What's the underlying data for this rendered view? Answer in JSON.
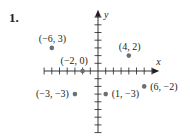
{
  "problem": {
    "number": "1."
  },
  "chart_data": {
    "type": "scatter",
    "title": "",
    "xlabel": "x",
    "ylabel": "y",
    "xlim": [
      -7,
      7
    ],
    "ylim": [
      -8,
      7
    ],
    "grid": false,
    "tick_spacing": 1,
    "points": [
      {
        "x": -6,
        "y": 3,
        "label": "(−6, 3)"
      },
      {
        "x": 4,
        "y": 2,
        "label": "(4, 2)"
      },
      {
        "x": -2,
        "y": 0,
        "label": "(−2, 0)"
      },
      {
        "x": 6,
        "y": -2,
        "label": "(6, −2)"
      },
      {
        "x": -3,
        "y": -3,
        "label": "(−3, −3)"
      },
      {
        "x": 1,
        "y": -3,
        "label": "(1, −3)"
      }
    ]
  },
  "colors": {
    "axis": "#231f20",
    "point": "#6d6e71",
    "text": "#231f20"
  }
}
